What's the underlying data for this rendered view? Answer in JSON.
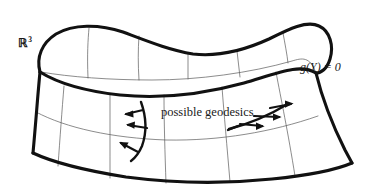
{
  "figure": {
    "type": "geometry-diagram",
    "background_color": "#ffffff",
    "ink_color": "#1a1a1a",
    "thick_stroke_color": "#111111",
    "thin_stroke_color": "#4a4a4a",
    "thick_stroke_width": 3.1,
    "thin_stroke_width": 0.7,
    "geodesic_stroke_width": 2.4
  },
  "labels": {
    "space": "ℝ",
    "space_exponent": "3",
    "constraint": "g(Y) = 0",
    "geodesics": "possible geodesics"
  },
  "surface": {
    "description": "Open saddle / trough surface drawn as a thick closed outline with a thin interior grid of u- and v-parameter lines.",
    "outer_outline": [
      [
        40,
        72
      ],
      [
        37,
        60
      ],
      [
        40,
        48
      ],
      [
        48,
        39
      ],
      [
        60,
        32
      ],
      [
        76,
        28
      ],
      [
        96,
        27
      ],
      [
        118,
        30
      ],
      [
        142,
        38
      ],
      [
        164,
        47
      ],
      [
        186,
        53
      ],
      [
        208,
        55
      ],
      [
        232,
        52
      ],
      [
        255,
        45
      ],
      [
        276,
        35
      ],
      [
        292,
        27
      ],
      [
        306,
        24
      ],
      [
        318,
        26
      ],
      [
        327,
        33
      ],
      [
        332,
        44
      ],
      [
        331,
        56
      ],
      [
        325,
        66
      ],
      [
        316,
        73
      ]
    ],
    "right_edge": [
      [
        316,
        73
      ],
      [
        322,
        98
      ],
      [
        330,
        122
      ],
      [
        342,
        146
      ],
      [
        352,
        163
      ]
    ],
    "bottom_edge": [
      [
        352,
        163
      ],
      [
        316,
        172
      ],
      [
        272,
        179
      ],
      [
        224,
        183
      ],
      [
        176,
        183
      ],
      [
        128,
        179
      ],
      [
        86,
        172
      ],
      [
        52,
        162
      ],
      [
        33,
        153
      ]
    ],
    "left_edge": [
      [
        33,
        153
      ],
      [
        34,
        130
      ],
      [
        36,
        108
      ],
      [
        38,
        90
      ],
      [
        40,
        72
      ]
    ],
    "inner_rim_lower": [
      [
        40,
        72
      ],
      [
        62,
        84
      ],
      [
        92,
        92
      ],
      [
        128,
        95
      ],
      [
        166,
        94
      ],
      [
        204,
        89
      ],
      [
        240,
        81
      ],
      [
        276,
        71
      ],
      [
        300,
        62
      ],
      [
        316,
        73
      ]
    ],
    "inner_rim_upper": [
      [
        40,
        72
      ],
      [
        66,
        76
      ],
      [
        100,
        79
      ],
      [
        140,
        80
      ],
      [
        182,
        79
      ],
      [
        222,
        75
      ],
      [
        258,
        69
      ],
      [
        288,
        62
      ],
      [
        306,
        56
      ],
      [
        316,
        73
      ]
    ],
    "grid_u_lines": 7,
    "grid_v_lines": 2
  },
  "geodesics": [
    {
      "name": "left-geodesic",
      "shape": "steep curved arc descending across the trough",
      "arrow_count": 3,
      "arrow_direction": "left"
    },
    {
      "name": "right-geodesic",
      "shape": "shallow diagonal line ascending to the right",
      "arrow_count": 3,
      "arrow_direction": "right"
    }
  ]
}
